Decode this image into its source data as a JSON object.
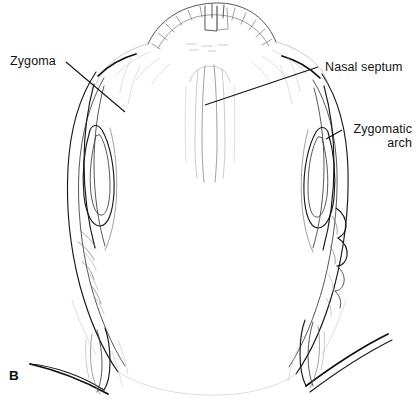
{
  "figure": {
    "panel_letter": "B",
    "background_color": "#ffffff",
    "ink_color": "#1a1a1a"
  },
  "labels": [
    {
      "id": "zygoma",
      "text": "Zygoma",
      "position": "upper-left",
      "leader_from": [
        66,
        62
      ],
      "leader_to": [
        125,
        112
      ]
    },
    {
      "id": "nasal-septum",
      "text": "Nasal septum",
      "position": "upper-right",
      "leader_from": [
        318,
        67
      ],
      "leader_to": [
        205,
        105
      ]
    },
    {
      "id": "zygomatic-arch",
      "line1": "Zygomatic",
      "line2": "arch",
      "position": "middle-right",
      "leader_from": [
        342,
        130
      ],
      "leader_to": [
        326,
        139
      ]
    }
  ],
  "anatomy": {
    "structures": [
      "maxillary dental arch",
      "hard palate",
      "nasal septum",
      "zygoma",
      "zygomatic arch",
      "temporal fossa",
      "cranial vault outline",
      "mandibular ramus fragment"
    ]
  }
}
